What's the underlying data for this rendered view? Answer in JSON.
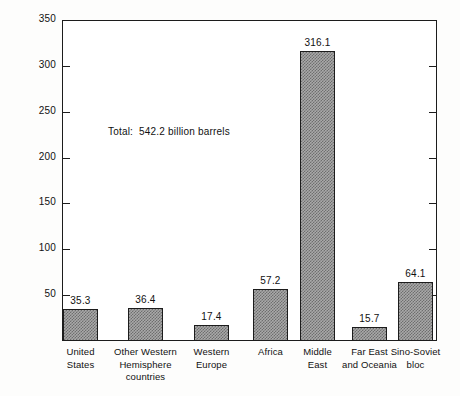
{
  "chart_data": {
    "type": "bar",
    "title": "",
    "subtitle": "",
    "xlabel": "",
    "ylabel": "Billions of barrels",
    "ylim": [
      0,
      350
    ],
    "yticks": [
      50,
      100,
      150,
      200,
      250,
      300,
      350
    ],
    "ytick_labels": [
      "50",
      "100",
      "150",
      "200",
      "250",
      "300",
      "350"
    ],
    "grid": false,
    "legend": null,
    "categories": [
      "United States",
      "Other Western Hemisphere countries",
      "Western Europe",
      "Africa",
      "Middle East",
      "Far East and Oceania",
      "Sino-Soviet bloc"
    ],
    "category_lines": [
      [
        "United",
        "States"
      ],
      [
        "Other Western",
        "Hemisphere",
        "countries"
      ],
      [
        "Western",
        "Europe"
      ],
      [
        "Africa"
      ],
      [
        "Middle",
        "East"
      ],
      [
        "Far East",
        "and Oceania"
      ],
      [
        "Sino-Soviet",
        "bloc"
      ]
    ],
    "values": [
      35.3,
      36.4,
      17.4,
      57.2,
      316.1,
      15.7,
      64.1
    ],
    "value_labels": [
      "35.3",
      "36.4",
      "17.4",
      "57.2",
      "316.1",
      "15.7",
      "64.1"
    ],
    "annotations": [
      {
        "text": "Total:  542.2 billion barrels"
      }
    ],
    "total": 542.2
  },
  "style": {
    "bar_fill": "#a9a9a9",
    "bar_hatch": "#6e6e6e",
    "axis_color": "#1c1c1c",
    "text_color": "#111111",
    "background": "#fdfdfc"
  }
}
